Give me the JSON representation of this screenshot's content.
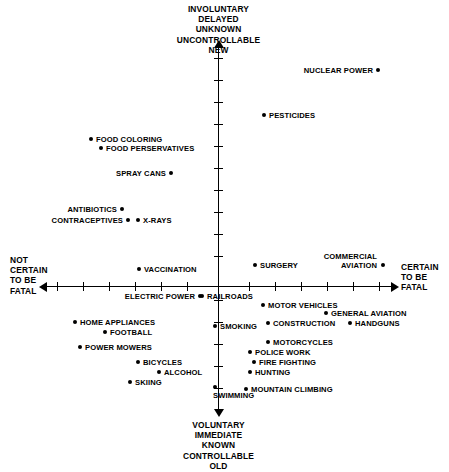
{
  "chart_data": {
    "type": "scatter",
    "title": "",
    "xlabel": "NOT CERTAIN TO BE FATAL ↔ CERTAIN TO BE FATAL",
    "ylabel": "VOLUNTARY/IMMEDIATE/KNOWN/CONTROLLABLE/OLD ↔ INVOLUNTARY/DELAYED/UNKNOWN/UNCONTROLLABLE/NEW",
    "grid": false,
    "legend": "none",
    "axis_captions": {
      "top": "INVOLUNTARY\nDELAYED\nUNKNOWN\nUNCONTROLLABLE\nNEW",
      "bottom": "VOLUNTARY\nIMMEDIATE\nKNOWN\nCONTROLLABLE\nOLD",
      "left": "NOT\nCERTAIN\nTO BE\nFATAL",
      "right": "CERTAIN\nTO BE\nFATAL"
    },
    "axes": {
      "x_origin_px": 218,
      "y_origin_px": 286,
      "x_tick_count": 13,
      "y_tick_count": 14
    },
    "points": [
      {
        "label": "NUCLEAR POWER",
        "x": 378,
        "y": 70,
        "side": "left"
      },
      {
        "label": "PESTICIDES",
        "x": 264,
        "y": 115,
        "side": "right"
      },
      {
        "label": "FOOD COLORING",
        "x": 91,
        "y": 139,
        "side": "right"
      },
      {
        "label": "FOOD PERSERVATIVES",
        "x": 101,
        "y": 148,
        "side": "right"
      },
      {
        "label": "SPRAY CANS",
        "x": 171,
        "y": 173,
        "side": "left"
      },
      {
        "label": "ANTIBIOTICS",
        "x": 122,
        "y": 209,
        "side": "left"
      },
      {
        "label": "CONTRACEPTIVES",
        "x": 128,
        "y": 220,
        "side": "left"
      },
      {
        "label": "X-RAYS",
        "x": 138,
        "y": 220,
        "side": "right"
      },
      {
        "label": "VACCINATION",
        "x": 139,
        "y": 269,
        "side": "right"
      },
      {
        "label": "SURGERY",
        "x": 255,
        "y": 265,
        "side": "right"
      },
      {
        "label": "COMMERCIAL AVIATION",
        "x": 383,
        "y": 265,
        "side": "left2"
      },
      {
        "label": "ELECTRIC POWER",
        "x": 200,
        "y": 296,
        "side": "left"
      },
      {
        "label": "RAILROADS",
        "x": 202,
        "y": 296,
        "side": "right"
      },
      {
        "label": "MOTOR VEHICLES",
        "x": 263,
        "y": 305,
        "side": "right"
      },
      {
        "label": "GENERAL AVIATION",
        "x": 326,
        "y": 313,
        "side": "right"
      },
      {
        "label": "HOME APPLIANCES",
        "x": 75,
        "y": 322,
        "side": "right"
      },
      {
        "label": "SMOKING",
        "x": 215,
        "y": 326,
        "side": "right"
      },
      {
        "label": "CONSTRUCTION",
        "x": 268,
        "y": 323,
        "side": "right"
      },
      {
        "label": "HANDGUNS",
        "x": 350,
        "y": 323,
        "side": "right"
      },
      {
        "label": "FOOTBALL",
        "x": 105,
        "y": 332,
        "side": "right"
      },
      {
        "label": "MOTORCYCLES",
        "x": 268,
        "y": 342,
        "side": "right"
      },
      {
        "label": "POWER MOWERS",
        "x": 80,
        "y": 347,
        "side": "right"
      },
      {
        "label": "POLICE WORK",
        "x": 250,
        "y": 352,
        "side": "right"
      },
      {
        "label": "BICYCLES",
        "x": 138,
        "y": 362,
        "side": "right"
      },
      {
        "label": "FIRE FIGHTING",
        "x": 254,
        "y": 362,
        "side": "right"
      },
      {
        "label": "ALCOHOL",
        "x": 159,
        "y": 372,
        "side": "right"
      },
      {
        "label": "HUNTING",
        "x": 250,
        "y": 372,
        "side": "right"
      },
      {
        "label": "SKIING",
        "x": 130,
        "y": 382,
        "side": "right"
      },
      {
        "label": "SWIMMING",
        "x": 215,
        "y": 387,
        "side": "below"
      },
      {
        "label": "MOUNTAIN CLIMBING",
        "x": 246,
        "y": 389,
        "side": "right"
      }
    ],
    "x_ticks_px": [
      57,
      83,
      109,
      135,
      161,
      187,
      249,
      275,
      301,
      327,
      353,
      379
    ],
    "y_ticks_px": [
      58,
      80,
      102,
      124,
      146,
      168,
      190,
      212,
      234,
      256,
      300,
      322,
      344,
      366,
      388
    ]
  },
  "colors": {
    "ink": "#000000",
    "background": "#ffffff"
  }
}
